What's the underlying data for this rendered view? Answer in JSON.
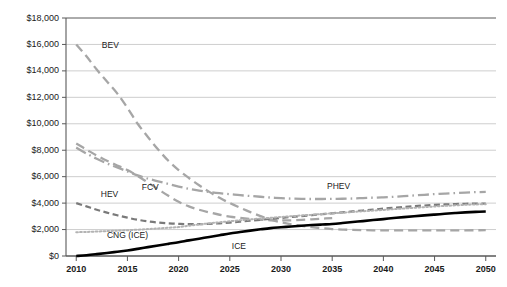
{
  "chart_data": {
    "type": "line",
    "title": "",
    "subtitle": "",
    "xlabel": "",
    "ylabel": "",
    "grid": true,
    "legend_position": "inline-labels",
    "x": [
      2010,
      2015,
      2020,
      2025,
      2030,
      2035,
      2040,
      2045,
      2050
    ],
    "xlim": [
      2009,
      2051
    ],
    "ylim": [
      0,
      18000
    ],
    "ytick_values": [
      0,
      2000,
      4000,
      6000,
      8000,
      10000,
      12000,
      14000,
      16000,
      18000
    ],
    "ytick_labels": [
      "$0",
      "$2,000",
      "$4,000",
      "$6,000",
      "$8,000",
      "$10,000",
      "$12,000",
      "$14,000",
      "$16,000",
      "$18,000"
    ],
    "xtick_labels": [
      "2010",
      "2015",
      "2020",
      "2025",
      "2030",
      "2035",
      "2040",
      "2045",
      "2050"
    ],
    "series": [
      {
        "name": "BEV",
        "label": "BEV",
        "color": "#a6a6a6",
        "style": "long-dash",
        "width": 2.3,
        "values": [
          16000,
          12200,
          8300,
          5600,
          3400,
          2300,
          1950,
          1930,
          1950
        ],
        "points": [
          [
            2010,
            16000
          ],
          [
            2011,
            15100
          ],
          [
            2012,
            14100
          ],
          [
            2013,
            13200
          ],
          [
            2014,
            12300
          ],
          [
            2015,
            11200
          ],
          [
            2016,
            10000
          ],
          [
            2017,
            9000
          ],
          [
            2018,
            8050
          ],
          [
            2019,
            7200
          ],
          [
            2020,
            6500
          ],
          [
            2021,
            5900
          ],
          [
            2022,
            5350
          ],
          [
            2023,
            4850
          ],
          [
            2024,
            4400
          ],
          [
            2025,
            4000
          ],
          [
            2026,
            3650
          ],
          [
            2027,
            3320
          ],
          [
            2028,
            3020
          ],
          [
            2029,
            2750
          ],
          [
            2030,
            2550
          ],
          [
            2031,
            2400
          ],
          [
            2032,
            2280
          ],
          [
            2033,
            2180
          ],
          [
            2034,
            2100
          ],
          [
            2035,
            2040
          ],
          [
            2036,
            2000
          ],
          [
            2037,
            1975
          ],
          [
            2038,
            1955
          ],
          [
            2039,
            1945
          ],
          [
            2040,
            1940
          ],
          [
            2042,
            1935
          ],
          [
            2045,
            1935
          ],
          [
            2048,
            1945
          ],
          [
            2050,
            1950
          ]
        ]
      },
      {
        "name": "FCV",
        "label": "FCV",
        "color": "#a6a6a6",
        "style": "long-dash",
        "width": 2.3,
        "values": [
          8500,
          6600,
          4050,
          2900,
          2700,
          2800,
          2950,
          3100,
          3250
        ],
        "points": [
          [
            2010,
            8500
          ],
          [
            2011,
            8050
          ],
          [
            2012,
            7600
          ],
          [
            2013,
            7200
          ],
          [
            2014,
            6850
          ],
          [
            2015,
            6500
          ],
          [
            2016,
            6050
          ],
          [
            2017,
            5550
          ],
          [
            2018,
            5050
          ],
          [
            2019,
            4550
          ],
          [
            2020,
            4100
          ],
          [
            2021,
            3750
          ],
          [
            2022,
            3500
          ],
          [
            2023,
            3300
          ],
          [
            2024,
            3120
          ],
          [
            2025,
            2980
          ],
          [
            2026,
            2880
          ],
          [
            2027,
            2800
          ],
          [
            2028,
            2740
          ],
          [
            2029,
            2700
          ],
          [
            2030,
            2690
          ],
          [
            2031,
            2700
          ],
          [
            2032,
            2730
          ],
          [
            2033,
            2770
          ],
          [
            2034,
            2820
          ],
          [
            2035,
            2870
          ]
        ]
      },
      {
        "name": "PHEV",
        "label": "PHEV",
        "color": "#a6a6a6",
        "style": "dash-dot",
        "width": 2.3,
        "values": [
          8200,
          6250,
          5150,
          4700,
          4400,
          4320,
          4380,
          4600,
          4850
        ],
        "points": [
          [
            2010,
            8200
          ],
          [
            2011,
            7750
          ],
          [
            2012,
            7350
          ],
          [
            2013,
            7000
          ],
          [
            2014,
            6700
          ],
          [
            2015,
            6400
          ],
          [
            2016,
            6100
          ],
          [
            2017,
            5850
          ],
          [
            2018,
            5650
          ],
          [
            2019,
            5450
          ],
          [
            2020,
            5250
          ],
          [
            2021,
            5080
          ],
          [
            2022,
            4950
          ],
          [
            2023,
            4840
          ],
          [
            2024,
            4750
          ],
          [
            2025,
            4680
          ],
          [
            2026,
            4600
          ],
          [
            2027,
            4540
          ],
          [
            2028,
            4480
          ],
          [
            2029,
            4420
          ],
          [
            2030,
            4380
          ],
          [
            2031,
            4340
          ],
          [
            2032,
            4320
          ],
          [
            2033,
            4310
          ],
          [
            2034,
            4310
          ],
          [
            2035,
            4320
          ],
          [
            2036,
            4330
          ],
          [
            2037,
            4350
          ],
          [
            2038,
            4380
          ],
          [
            2039,
            4410
          ],
          [
            2040,
            4440
          ],
          [
            2041,
            4480
          ],
          [
            2042,
            4530
          ],
          [
            2043,
            4580
          ],
          [
            2044,
            4630
          ],
          [
            2045,
            4680
          ],
          [
            2046,
            4720
          ],
          [
            2047,
            4760
          ],
          [
            2048,
            4800
          ],
          [
            2049,
            4830
          ],
          [
            2050,
            4850
          ]
        ]
      },
      {
        "name": "HEV",
        "label": "HEV",
        "color": "#7a7a7a",
        "style": "medium-dash",
        "width": 2.2,
        "values": [
          4000,
          2850,
          2450,
          2650,
          2900,
          3150,
          3400,
          3700,
          3950
        ],
        "points": [
          [
            2010,
            4000
          ],
          [
            2011,
            3750
          ],
          [
            2012,
            3500
          ],
          [
            2013,
            3280
          ],
          [
            2014,
            3080
          ],
          [
            2015,
            2900
          ],
          [
            2016,
            2740
          ],
          [
            2017,
            2620
          ],
          [
            2018,
            2530
          ],
          [
            2019,
            2470
          ],
          [
            2020,
            2430
          ],
          [
            2021,
            2410
          ],
          [
            2022,
            2410
          ],
          [
            2023,
            2430
          ],
          [
            2024,
            2470
          ],
          [
            2025,
            2530
          ],
          [
            2026,
            2600
          ],
          [
            2027,
            2670
          ],
          [
            2028,
            2740
          ],
          [
            2029,
            2810
          ],
          [
            2030,
            2880
          ],
          [
            2031,
            2950
          ],
          [
            2032,
            3020
          ],
          [
            2033,
            3090
          ],
          [
            2034,
            3160
          ],
          [
            2035,
            3230
          ],
          [
            2036,
            3300
          ],
          [
            2037,
            3370
          ],
          [
            2038,
            3440
          ],
          [
            2039,
            3510
          ],
          [
            2040,
            3580
          ],
          [
            2041,
            3650
          ],
          [
            2042,
            3710
          ],
          [
            2043,
            3770
          ],
          [
            2044,
            3820
          ],
          [
            2045,
            3870
          ],
          [
            2046,
            3900
          ],
          [
            2047,
            3930
          ],
          [
            2048,
            3950
          ],
          [
            2049,
            3960
          ],
          [
            2050,
            3960
          ]
        ]
      },
      {
        "name": "CNG (ICE)",
        "label": "CNG (ICE)",
        "color": "#b3b3b3",
        "style": "dotted",
        "width": 2.0,
        "values": [
          1800,
          1950,
          2180,
          2620,
          2950,
          3220,
          3480,
          3720,
          3920
        ],
        "points": [
          [
            2010,
            1800
          ],
          [
            2011,
            1820
          ],
          [
            2012,
            1850
          ],
          [
            2013,
            1880
          ],
          [
            2014,
            1915
          ],
          [
            2015,
            1950
          ],
          [
            2016,
            1990
          ],
          [
            2017,
            2035
          ],
          [
            2018,
            2085
          ],
          [
            2019,
            2135
          ],
          [
            2020,
            2190
          ],
          [
            2021,
            2290
          ],
          [
            2022,
            2390
          ],
          [
            2023,
            2470
          ],
          [
            2024,
            2550
          ],
          [
            2025,
            2625
          ],
          [
            2026,
            2700
          ],
          [
            2027,
            2770
          ],
          [
            2028,
            2830
          ],
          [
            2029,
            2890
          ],
          [
            2030,
            2950
          ],
          [
            2031,
            3010
          ],
          [
            2032,
            3065
          ],
          [
            2033,
            3120
          ],
          [
            2034,
            3175
          ],
          [
            2035,
            3225
          ],
          [
            2036,
            3280
          ],
          [
            2037,
            3330
          ],
          [
            2038,
            3385
          ],
          [
            2039,
            3435
          ],
          [
            2040,
            3485
          ],
          [
            2041,
            3540
          ],
          [
            2042,
            3590
          ],
          [
            2043,
            3645
          ],
          [
            2044,
            3695
          ],
          [
            2045,
            3745
          ],
          [
            2046,
            3790
          ],
          [
            2047,
            3830
          ],
          [
            2048,
            3870
          ],
          [
            2049,
            3900
          ],
          [
            2050,
            3920
          ]
        ]
      },
      {
        "name": "ICE",
        "label": "ICE",
        "color": "#000000",
        "style": "solid",
        "width": 2.6,
        "values": [
          0,
          380,
          1000,
          1680,
          2180,
          2400,
          2680,
          3000,
          3350
        ],
        "points": [
          [
            2010,
            0
          ],
          [
            2011,
            60
          ],
          [
            2012,
            140
          ],
          [
            2013,
            230
          ],
          [
            2014,
            320
          ],
          [
            2015,
            420
          ],
          [
            2016,
            540
          ],
          [
            2017,
            670
          ],
          [
            2018,
            800
          ],
          [
            2019,
            920
          ],
          [
            2020,
            1040
          ],
          [
            2021,
            1180
          ],
          [
            2022,
            1310
          ],
          [
            2023,
            1440
          ],
          [
            2024,
            1570
          ],
          [
            2025,
            1700
          ],
          [
            2026,
            1810
          ],
          [
            2027,
            1920
          ],
          [
            2028,
            2020
          ],
          [
            2029,
            2110
          ],
          [
            2030,
            2170
          ],
          [
            2031,
            2230
          ],
          [
            2032,
            2290
          ],
          [
            2033,
            2340
          ],
          [
            2034,
            2380
          ],
          [
            2035,
            2420
          ],
          [
            2036,
            2490
          ],
          [
            2037,
            2570
          ],
          [
            2038,
            2640
          ],
          [
            2039,
            2720
          ],
          [
            2040,
            2790
          ],
          [
            2041,
            2870
          ],
          [
            2042,
            2940
          ],
          [
            2043,
            3010
          ],
          [
            2044,
            3070
          ],
          [
            2045,
            3130
          ],
          [
            2046,
            3190
          ],
          [
            2047,
            3250
          ],
          [
            2048,
            3300
          ],
          [
            2049,
            3340
          ],
          [
            2050,
            3370
          ]
        ]
      }
    ],
    "annotations": [
      {
        "name": "bev-label",
        "text": "BEV",
        "x": 2012.5,
        "y": 15900
      },
      {
        "name": "fcv-label",
        "text": "FCV",
        "x": 2016.4,
        "y": 5150
      },
      {
        "name": "phev-label",
        "text": "PHEV",
        "x": 2034.5,
        "y": 5200
      },
      {
        "name": "hev-label",
        "text": "HEV",
        "x": 2012.4,
        "y": 4600
      },
      {
        "name": "cng-label",
        "text": "CNG (ICE)",
        "x": 2013.0,
        "y": 1500
      },
      {
        "name": "ice-label",
        "text": "ICE",
        "x": 2025.2,
        "y": 700
      }
    ],
    "colors": {
      "grid": "#c8c8c8",
      "axis": "#808080",
      "axis_strong": "#595959",
      "background": "#ffffff",
      "text": "#1a1a1a"
    }
  }
}
